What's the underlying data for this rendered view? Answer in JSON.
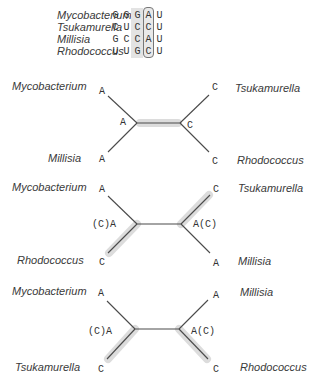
{
  "alignment": {
    "rows": [
      {
        "species": "Mycobacterium",
        "seq": [
          "G",
          "G",
          "G",
          "A",
          "U"
        ]
      },
      {
        "species": "Tsukamurella",
        "seq": [
          "C",
          "U",
          "C",
          "C",
          "U"
        ]
      },
      {
        "species": "Millisia",
        "seq": [
          "G",
          "C",
          "C",
          "A",
          "U"
        ]
      },
      {
        "species": "Rhodococcus",
        "seq": [
          "U",
          "U",
          "G",
          "C",
          "U"
        ]
      }
    ],
    "shaded_column_index": 2,
    "boxed_column_index": 3
  },
  "trees": [
    {
      "top_left": {
        "species": "Mycobacterium",
        "state": "A"
      },
      "bottom_left": {
        "species": "Millisia",
        "state": "A"
      },
      "top_right": {
        "species": "Tsukamurella",
        "state": "C"
      },
      "bottom_right": {
        "species": "Rhodococcus",
        "state": "C"
      },
      "left_node": "A",
      "right_node": "C",
      "highlight": "internal-branch"
    },
    {
      "top_left": {
        "species": "Mycobacterium",
        "state": "A"
      },
      "bottom_left": {
        "species": "Rhodococcus",
        "state": "C"
      },
      "top_right": {
        "species": "Tsukamurella",
        "state": "C"
      },
      "bottom_right": {
        "species": "Millisia",
        "state": "A"
      },
      "left_node": "(C)A",
      "right_node": "A(C)",
      "highlight": "bottom-left and top-right branches"
    },
    {
      "top_left": {
        "species": "Mycobacterium",
        "state": "A"
      },
      "bottom_left": {
        "species": "Tsukamurella",
        "state": "C"
      },
      "top_right": {
        "species": "Millisia",
        "state": "A"
      },
      "bottom_right": {
        "species": "Rhodococcus",
        "state": "C"
      },
      "left_node": "(C)A",
      "right_node": "A(C)",
      "highlight": "bottom-left and bottom-right branches"
    }
  ],
  "colors": {
    "line": "#4a4a4a",
    "highlight": "#d9d9d9",
    "box": "#777777"
  }
}
